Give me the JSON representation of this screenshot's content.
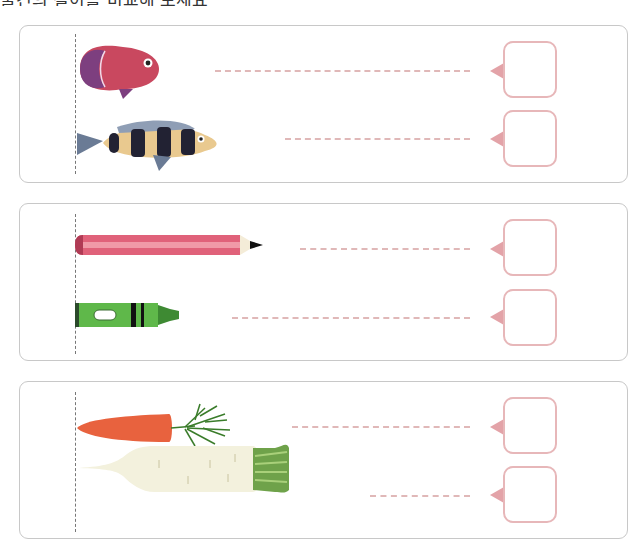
{
  "worksheet": {
    "title_partial": "물건의 길이를 비교해 보세요",
    "colors": {
      "panel_border": "#c8c8c8",
      "trace_line": "#e0b8b8",
      "answer_box_border": "#e7b7b9",
      "pointer": "#e3a3a8"
    },
    "groups": [
      {
        "name": "fish",
        "items": [
          {
            "name": "round-fish",
            "answer": ""
          },
          {
            "name": "striped-fish",
            "answer": ""
          }
        ]
      },
      {
        "name": "writing-tools",
        "items": [
          {
            "name": "pencil",
            "answer": ""
          },
          {
            "name": "crayon",
            "answer": ""
          }
        ]
      },
      {
        "name": "vegetables",
        "items": [
          {
            "name": "carrot",
            "answer": ""
          },
          {
            "name": "radish",
            "answer": ""
          }
        ]
      }
    ]
  }
}
